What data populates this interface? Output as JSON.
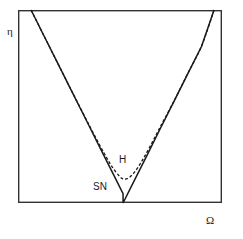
{
  "figure": {
    "background_color": "#ffffff",
    "frame": {
      "x": 18,
      "y": 10,
      "width": 204,
      "height": 193,
      "stroke_color": "#333333",
      "stroke_width": 1.4
    }
  },
  "axes": {
    "y_label": "η",
    "x_label": "Ω"
  },
  "annotations": [
    {
      "name": "hopf-label",
      "text": "H"
    },
    {
      "name": "saddle-node-label",
      "text": "SN"
    }
  ],
  "chart_data": {
    "type": "line",
    "title": "",
    "xlabel": "Ω",
    "ylabel": "η",
    "xlim": [
      0,
      1
    ],
    "ylim": [
      0,
      1
    ],
    "grid": false,
    "legend": "none",
    "axis_ticks": "none",
    "annotations": [
      {
        "label": "H",
        "x": 0.512,
        "y": 0.222,
        "description": "Hopf bifurcation curve label"
      },
      {
        "label": "SN",
        "x": 0.402,
        "y": 0.084,
        "description": "Saddle-node bifurcation curve label"
      }
    ],
    "series": [
      {
        "name": "SN",
        "style": "solid",
        "color": "#1a1a1a",
        "width": 1.5,
        "description": "V-shaped saddle-node boundary with sharp vertex on the horizontal axis",
        "points": [
          [
            0.064,
            1.0
          ],
          [
            0.132,
            0.856
          ],
          [
            0.2,
            0.713
          ],
          [
            0.268,
            0.569
          ],
          [
            0.336,
            0.426
          ],
          [
            0.404,
            0.282
          ],
          [
            0.472,
            0.139
          ],
          [
            0.515,
            0.048
          ],
          [
            0.515,
            0.0
          ],
          [
            0.56,
            0.095
          ],
          [
            0.628,
            0.238
          ],
          [
            0.696,
            0.382
          ],
          [
            0.764,
            0.525
          ],
          [
            0.832,
            0.669
          ],
          [
            0.9,
            0.812
          ],
          [
            0.961,
            1.0
          ]
        ]
      },
      {
        "name": "H",
        "style": "dashed",
        "color": "#1a1a1a",
        "width": 1.3,
        "dash_pattern": "3,2",
        "description": "U-shaped Hopf boundary tangent to SN far from the vertex, lifting off to a rounded minimum above the axis",
        "points": [
          [
            0.064,
            1.0
          ],
          [
            0.132,
            0.856
          ],
          [
            0.2,
            0.713
          ],
          [
            0.268,
            0.57
          ],
          [
            0.336,
            0.43
          ],
          [
            0.38,
            0.34
          ],
          [
            0.42,
            0.262
          ],
          [
            0.452,
            0.203
          ],
          [
            0.478,
            0.163
          ],
          [
            0.498,
            0.138
          ],
          [
            0.512,
            0.126
          ],
          [
            0.526,
            0.124
          ],
          [
            0.545,
            0.132
          ],
          [
            0.565,
            0.152
          ],
          [
            0.59,
            0.188
          ],
          [
            0.62,
            0.24
          ],
          [
            0.66,
            0.318
          ],
          [
            0.7,
            0.4
          ],
          [
            0.764,
            0.527
          ],
          [
            0.832,
            0.671
          ],
          [
            0.9,
            0.814
          ],
          [
            0.961,
            1.0
          ]
        ]
      }
    ]
  }
}
